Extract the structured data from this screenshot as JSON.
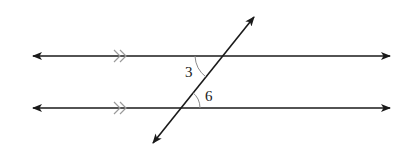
{
  "diagram": {
    "type": "parallel-lines-cut-by-transversal",
    "colors": {
      "line": "#1a1a1a",
      "tick_marks": "#9a9a9a",
      "arcs": "#8a8a8a",
      "background": "#ffffff"
    },
    "lines": [
      {
        "id": "top-line",
        "y": 56,
        "x1": 33,
        "x2": 390,
        "arrows": "both"
      },
      {
        "id": "bottom-line",
        "y": 108,
        "x1": 33,
        "x2": 390,
        "arrows": "both"
      }
    ],
    "transversal": {
      "x1": 153,
      "y1": 143,
      "x2": 254,
      "y2": 17,
      "arrows": "both"
    },
    "parallel_marks": {
      "count_per_line": 2,
      "x": 114
    },
    "angles": [
      {
        "label": "3",
        "position": "top intersection, lower-left"
      },
      {
        "label": "6",
        "position": "bottom intersection, upper-right"
      }
    ]
  }
}
